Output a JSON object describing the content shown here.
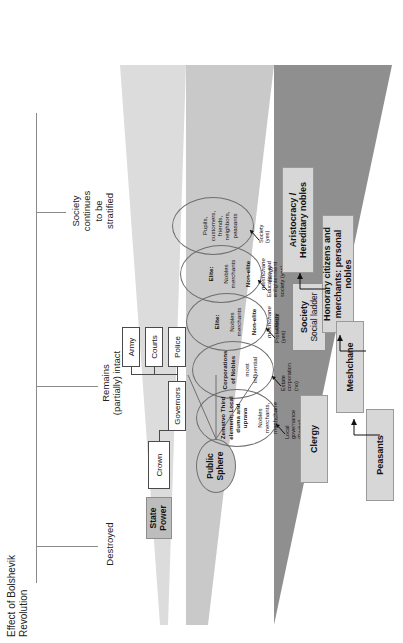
{
  "figure": {
    "title": "Effect of Bolshevik Revolution",
    "annotations": [
      {
        "id": "destroyed",
        "label": "Destroyed"
      },
      {
        "id": "remains-partially-intact",
        "label": "Remains\n(partially) intact"
      },
      {
        "id": "society-stratified",
        "label": "Society\ncontinues\nto be\nstratified"
      }
    ]
  },
  "state_power": {
    "heading": "State\nPower",
    "nodes": [
      {
        "id": "crown",
        "label": "Crown"
      },
      {
        "id": "governors",
        "label": "Governors"
      },
      {
        "id": "police",
        "label": "Police"
      },
      {
        "id": "courts",
        "label": "Courts"
      },
      {
        "id": "army",
        "label": "Army"
      }
    ]
  },
  "public_sphere": {
    "heading": "Public\nSphere",
    "groups": [
      {
        "id": "zemstvo",
        "bold": "Zemstvo Third\nelement; Local\nduma and\nuprava",
        "rest": "Nobles\nmerchants,\nmeshchane"
      },
      {
        "id": "corporations-of-nobles",
        "bold": "Corporations\nof Nobles",
        "rest": "most\ninfluential"
      },
      {
        "id": "elite-nobles-1",
        "bold": "Elite:",
        "rest": "Nobles\nmerchants",
        "bold2": "Non-elite",
        "rest2": "meshchane\nclergy"
      },
      {
        "id": "elite-nobles-2",
        "bold": "Elite:",
        "rest": "Nobles\nmerchants",
        "bold2": "Non-elite",
        "rest2": "meshchane\nclergy"
      },
      {
        "id": "pupils-customers",
        "bold": "",
        "rest": "Pupils,\ncustomers,\nfriends,\nneighbors,\npeasants"
      }
    ],
    "arrow_labels": [
      {
        "id": "local-governance",
        "label": "Local\ngovernance\n(Partial)"
      },
      {
        "id": "estate-corporation",
        "label": "Estate\ncorporation\n(no)"
      },
      {
        "id": "professions",
        "label": "Professions\n(yes)"
      },
      {
        "id": "education-enlightenment",
        "label": "Education and\nenlightenment\nsociety (yes)"
      },
      {
        "id": "society-yes",
        "label": "Society\n(yes)"
      }
    ]
  },
  "society": {
    "heading_line1": "Society",
    "heading_line2": "Social ladder",
    "ladder": [
      {
        "id": "aristocracy",
        "label": "Aristocracy / Hereditary\nnobles"
      },
      {
        "id": "honorary-citizens",
        "label": "Honorary citizens and\nmerchants: personal nobles"
      },
      {
        "id": "clergy",
        "label": "Clergy"
      },
      {
        "id": "meshchane",
        "label": "Meshchane"
      },
      {
        "id": "peasants",
        "label": "Peasants"
      }
    ]
  },
  "colors": {
    "band_state": "#dcdcdc",
    "band_public": "#c9c9c9",
    "band_society": "#8f8f8f",
    "box_fill": "#ffffff",
    "ladder_fill": "#d7d7d7",
    "rail": "#8a8a8a"
  }
}
